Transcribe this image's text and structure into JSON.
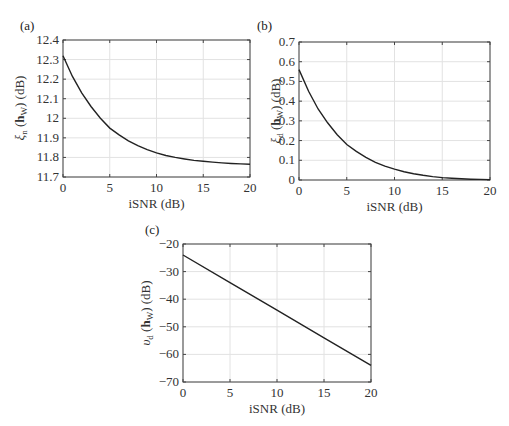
{
  "chart_data": [
    {
      "panel": "(a)",
      "type": "line",
      "title": "",
      "xlabel": "iSNR (dB)",
      "ylabel": "ξn (hW) (dB)",
      "ylabel_parts": {
        "sym": "ξ",
        "sub": "n",
        "arg": "h",
        "argsub": "W",
        "unit": "(dB)"
      },
      "xlim": [
        0,
        20
      ],
      "ylim": [
        11.7,
        12.4
      ],
      "xticks": [
        0,
        5,
        10,
        15,
        20
      ],
      "yticks": [
        11.7,
        11.8,
        11.9,
        12,
        12.1,
        12.2,
        12.3,
        12.4
      ],
      "ytick_labels": [
        "11.7",
        "11.8",
        "11.9",
        "12",
        "12.1",
        "12.2",
        "12.3",
        "12.4"
      ],
      "grid": true,
      "x": [
        0,
        1,
        2,
        3,
        4,
        5,
        6,
        7,
        8,
        9,
        10,
        11,
        12,
        13,
        14,
        15,
        16,
        17,
        18,
        19,
        20
      ],
      "values": [
        12.32,
        12.215,
        12.13,
        12.06,
        12.0,
        11.95,
        11.915,
        11.885,
        11.86,
        11.84,
        11.823,
        11.81,
        11.8,
        11.792,
        11.785,
        11.78,
        11.776,
        11.772,
        11.769,
        11.767,
        11.765
      ]
    },
    {
      "panel": "(b)",
      "type": "line",
      "title": "",
      "xlabel": "iSNR (dB)",
      "ylabel": "ξd (hW) (dB)",
      "ylabel_parts": {
        "sym": "ξ",
        "sub": "d",
        "arg": "h",
        "argsub": "W",
        "unit": "(dB)"
      },
      "xlim": [
        0,
        20
      ],
      "ylim": [
        0,
        0.7
      ],
      "xticks": [
        0,
        5,
        10,
        15,
        20
      ],
      "yticks": [
        0,
        0.1,
        0.2,
        0.3,
        0.4,
        0.5,
        0.6,
        0.7
      ],
      "ytick_labels": [
        "0",
        "0.1",
        "0.2",
        "0.3",
        "0.4",
        "0.5",
        "0.6",
        "0.7"
      ],
      "grid": true,
      "x": [
        0,
        1,
        2,
        3,
        4,
        5,
        6,
        7,
        8,
        9,
        10,
        11,
        12,
        13,
        14,
        15,
        16,
        17,
        18,
        19,
        20
      ],
      "values": [
        0.56,
        0.45,
        0.36,
        0.29,
        0.23,
        0.18,
        0.145,
        0.115,
        0.09,
        0.07,
        0.055,
        0.042,
        0.032,
        0.024,
        0.017,
        0.012,
        0.009,
        0.006,
        0.004,
        0.003,
        0.002
      ]
    },
    {
      "panel": "(c)",
      "type": "line",
      "title": "",
      "xlabel": "iSNR (dB)",
      "ylabel": "υd (hW) (dB)",
      "ylabel_parts": {
        "sym": "υ",
        "sub": "d",
        "arg": "h",
        "argsub": "W",
        "unit": "(dB)"
      },
      "xlim": [
        0,
        20
      ],
      "ylim": [
        -70,
        -20
      ],
      "xticks": [
        0,
        5,
        10,
        15,
        20
      ],
      "yticks": [
        -70,
        -60,
        -50,
        -40,
        -30,
        -20
      ],
      "ytick_labels": [
        "−70",
        "−60",
        "−50",
        "−40",
        "−30",
        "−20"
      ],
      "grid": true,
      "x": [
        0,
        5,
        10,
        15,
        20
      ],
      "values": [
        -24,
        -34,
        -44,
        -54,
        -64
      ]
    }
  ],
  "panels": {
    "a": {
      "label": "(a)"
    },
    "b": {
      "label": "(b)"
    },
    "c": {
      "label": "(c)"
    }
  }
}
